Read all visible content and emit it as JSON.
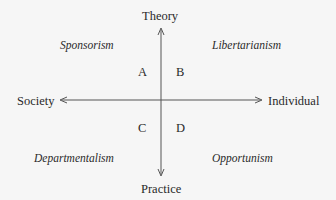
{
  "diagram": {
    "axes": {
      "top": "Theory",
      "bottom": "Practice",
      "left": "Society",
      "right": "Individual"
    },
    "quadrants": [
      {
        "letter": "A",
        "name": "Sponsorism",
        "position": "top-left"
      },
      {
        "letter": "B",
        "name": "Libertarianism",
        "position": "top-right"
      },
      {
        "letter": "C",
        "name": "Departmentalism",
        "position": "bottom-left"
      },
      {
        "letter": "D",
        "name": "Opportunism",
        "position": "bottom-right"
      }
    ],
    "colors": {
      "line": "#555555",
      "text": "#2a2a2a",
      "background": "#f6f6f6"
    }
  }
}
